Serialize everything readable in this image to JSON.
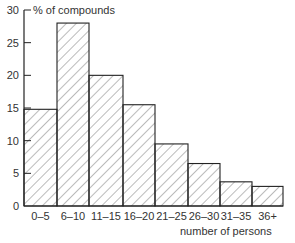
{
  "chart_data": {
    "type": "bar",
    "title": "",
    "ylabel": "% of compounds",
    "xlabel": "number of persons",
    "categories": [
      "0–5",
      "6–10",
      "11–15",
      "16–20",
      "21–25",
      "26–30",
      "31–35",
      "36+"
    ],
    "values": [
      14.8,
      28,
      20,
      15.5,
      9.5,
      6.5,
      3.7,
      3.0
    ],
    "yticks": [
      "0",
      "5",
      "10",
      "15",
      "20",
      "25",
      "30"
    ],
    "ylim": [
      0,
      30
    ],
    "grid": false,
    "legend": "none",
    "bar_fill": "diagonal hatch",
    "bar_stroke": "#222222"
  }
}
